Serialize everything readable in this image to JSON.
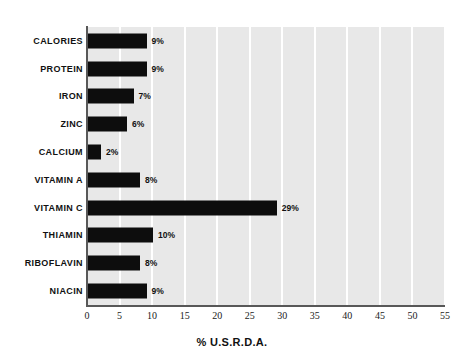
{
  "chart_data": {
    "type": "bar",
    "orientation": "horizontal",
    "title": "",
    "subtitle": "",
    "xlabel": "% U.S.R.D.A.",
    "ylabel": "",
    "xlim": [
      0,
      55
    ],
    "xticks": [
      0,
      5,
      10,
      15,
      20,
      25,
      30,
      35,
      40,
      45,
      50,
      55
    ],
    "xtick_labels": [
      "0",
      "5",
      "10",
      "15",
      "20",
      "25",
      "30",
      "35",
      "40",
      "45",
      "50",
      "55"
    ],
    "grid": "vertical-white-gridlines-at-xticks",
    "legend": "none",
    "categories": [
      "CALORIES",
      "PROTEIN",
      "IRON",
      "ZINC",
      "CALCIUM",
      "VITAMIN A",
      "VITAMIN C",
      "THIAMIN",
      "RIBOFLAVIN",
      "NIACIN"
    ],
    "values": [
      9,
      9,
      7,
      6,
      2,
      8,
      29,
      10,
      8,
      9
    ],
    "data_labels": [
      "9%",
      "9%",
      "7%",
      "6%",
      "2%",
      "8%",
      "29%",
      "10%",
      "8%",
      "9%"
    ],
    "bars": [
      {
        "category": "CALORIES",
        "value": 9,
        "label": "9%"
      },
      {
        "category": "PROTEIN",
        "value": 9,
        "label": "9%"
      },
      {
        "category": "IRON",
        "value": 7,
        "label": "7%"
      },
      {
        "category": "ZINC",
        "value": 6,
        "label": "6%"
      },
      {
        "category": "CALCIUM",
        "value": 2,
        "label": "2%"
      },
      {
        "category": "VITAMIN A",
        "value": 8,
        "label": "8%"
      },
      {
        "category": "VITAMIN C",
        "value": 29,
        "label": "29%"
      },
      {
        "category": "THIAMIN",
        "value": 10,
        "label": "10%"
      },
      {
        "category": "RIBOFLAVIN",
        "value": 8,
        "label": "8%"
      },
      {
        "category": "NIACIN",
        "value": 9,
        "label": "9%"
      }
    ],
    "colors": {
      "bar": "#0d0d0d",
      "plot_background": "#e8e8e8",
      "gridline": "#ffffff",
      "axis_line": "#585858",
      "text": "#111111",
      "page_background": "#ffffff"
    }
  }
}
